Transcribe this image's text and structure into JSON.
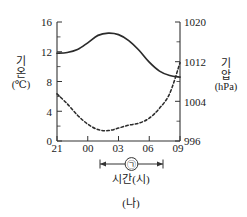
{
  "caption": "(나)",
  "chart_data": {
    "type": "line",
    "title": "",
    "subtitle": "",
    "xlabel": "시간(시)",
    "ylabel": "기온(℃)",
    "y2label": "기압(hPa)",
    "grid": false,
    "legend_position": "none",
    "x": [
      "21",
      "00",
      "03",
      "06",
      "09"
    ],
    "x_ticks": [
      "21",
      "00",
      "03",
      "06",
      "09"
    ],
    "xlim": [
      21,
      33
    ],
    "ylim": [
      0,
      16
    ],
    "y_ticks": [
      "0",
      "4",
      "8",
      "12",
      "16"
    ],
    "y2lim": [
      996,
      1020
    ],
    "y2_ticks": [
      "996",
      "1004",
      "1012",
      "1020"
    ],
    "y_minor_step": 2,
    "y2_minor_step": 4,
    "series": [
      {
        "name": "기온",
        "axis": "left",
        "style": "solid",
        "unit": "℃",
        "x": [
          21,
          22,
          23,
          24,
          25,
          26,
          27,
          28,
          29,
          30,
          31,
          32,
          33
        ],
        "values": [
          11.8,
          11.9,
          12.3,
          13.2,
          14.2,
          14.5,
          14.3,
          13.5,
          12.2,
          10.6,
          9.4,
          8.8,
          8.6
        ]
      },
      {
        "name": "기압",
        "axis": "right",
        "style": "dashed",
        "unit": "hPa",
        "x": [
          21,
          22,
          23,
          24,
          25,
          26,
          27,
          28,
          29,
          30,
          31,
          32,
          33
        ],
        "values": [
          1005.5,
          1003.5,
          1001.2,
          999.4,
          998.3,
          998.1,
          998.6,
          999.2,
          999.6,
          1000.6,
          1002.6,
          1005.6,
          1011.8
        ]
      }
    ],
    "annotations": [
      {
        "name": "span-arrow",
        "label": "㉠",
        "x_start": 25.2,
        "x_end": 31.5
      }
    ]
  }
}
